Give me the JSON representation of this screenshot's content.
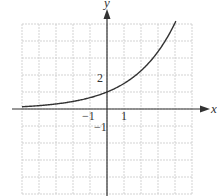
{
  "chart_data": {
    "type": "line",
    "title": "",
    "xlabel": "x",
    "ylabel": "y",
    "xlim": [
      -5,
      5
    ],
    "ylim": [
      -5,
      5
    ],
    "grid": true,
    "tick_labels": {
      "x": [
        {
          "value": -1,
          "label": "−1"
        },
        {
          "value": 1,
          "label": "1"
        }
      ],
      "y": [
        {
          "value": 2,
          "label": "2"
        },
        {
          "value": -1,
          "label": "−1"
        }
      ]
    },
    "series": [
      {
        "name": "y = (3/2)^x",
        "function": "exponential growth, y(0)=1",
        "x": [
          -5,
          -4,
          -3,
          -2,
          -1,
          0,
          1,
          2,
          3,
          4
        ],
        "y": [
          0.13,
          0.2,
          0.3,
          0.44,
          0.67,
          1.0,
          1.5,
          2.25,
          3.38,
          5.06
        ]
      }
    ],
    "legend": null
  },
  "labels": {
    "x_axis": "x",
    "y_axis": "y",
    "tick_y_2": "2",
    "tick_x_neg1": "−1",
    "tick_x_1": "1",
    "tick_y_neg1": "−1"
  },
  "colors": {
    "grid": "#c8c8c8",
    "axis": "#333333",
    "curve": "#333333",
    "background": "#ffffff"
  }
}
